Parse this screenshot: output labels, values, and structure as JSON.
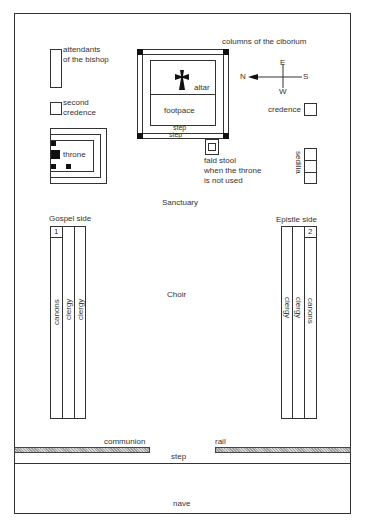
{
  "diagram": {
    "title_areas": {
      "sanctuary": "Sanctuary",
      "choir": "Choir",
      "nave": "nave"
    },
    "ciborium": {
      "label": "columns of the ciborium",
      "altar_label": "altar",
      "footpace_label": "footpace",
      "step_upper": "step",
      "step_lower": "step",
      "cross_icon": "cross-pattee"
    },
    "compass": {
      "north": "N",
      "south": "S",
      "east": "E",
      "west": "W"
    },
    "left_items": {
      "attendants_line1": "attendants",
      "attendants_line2": "of the bishop",
      "second_credence_line1": "second",
      "second_credence_line2": "credence",
      "throne": "throne"
    },
    "right_items": {
      "credence": "credence",
      "sedilia": "sedilia",
      "fald_stool_line1": "fald stool",
      "fald_stool_line2": "when the throne",
      "fald_stool_line3": "is not used"
    },
    "gospel_side": {
      "heading": "Gospel side",
      "number": "1",
      "columns": [
        "canons",
        "clergy",
        "clergy"
      ]
    },
    "epistle_side": {
      "heading": "Epistle side",
      "number": "2",
      "columns": [
        "clergy",
        "clergy",
        "canons"
      ]
    },
    "communion_rail": {
      "left_label": "communion",
      "right_label": "rail",
      "step_label": "step"
    },
    "colors": {
      "line": "#333333",
      "background": "#ffffff",
      "column_fill": "#111111"
    }
  }
}
